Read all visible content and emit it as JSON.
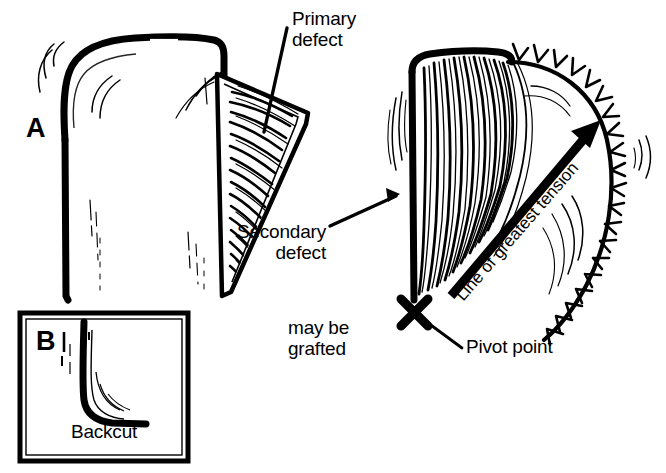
{
  "figure": {
    "type": "medical-illustration",
    "background_color": "#ffffff",
    "ink_color": "#000000"
  },
  "panels": [
    {
      "id": "A",
      "letter": "A",
      "description": "Pre-operative flap design showing primary defect, secondary defect and transposition flap"
    },
    {
      "id": "B",
      "letter": "B",
      "caption": "Backcut",
      "description": "Inset box illustrating a backcut at the base of the flap"
    }
  ],
  "labels": {
    "panel_a_letter": "A",
    "panel_b_letter": "B",
    "primary_defect": "Primary\ndefect",
    "primary_defect_line1": "Primary",
    "primary_defect_line2": "defect",
    "secondary_defect": "Secondary\ndefect",
    "secondary_defect_line1": "Secondary",
    "secondary_defect_line2": "defect",
    "may_be_grafted": "may be\ngrafted",
    "may_be_grafted_line1": "may be",
    "may_be_grafted_line2": "grafted",
    "line_of_greatest_tension": "Line of greatest tension",
    "pivot_point": "Pivot point",
    "backcut": "Backcut"
  },
  "markers": {
    "pivot_point_symbol": "X",
    "pivot_point_position": {
      "x": 414,
      "y": 312
    },
    "tension_arrow": {
      "from": {
        "x": 452,
        "y": 294
      },
      "to": {
        "x": 597,
        "y": 124
      },
      "angle_degrees": -49
    }
  },
  "graphics": {
    "suture_line": {
      "name": "suture-line",
      "stitch_count": 22,
      "description": "Closed curvilinear suture line with transverse stitch marks"
    },
    "dashed_incision": {
      "name": "dashed-incision-line",
      "description": "Dashed vertical line marking planned incision at edge of primary defect"
    },
    "hatching": {
      "name": "flap-hatching",
      "description": "Dense curved hatch strokes indicating undermined / raised flap tissue"
    }
  }
}
